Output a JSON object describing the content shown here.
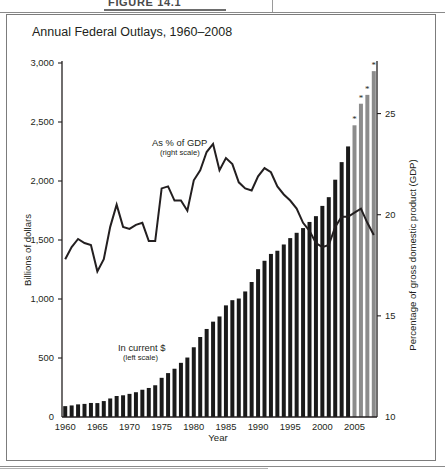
{
  "page": {
    "figure_caption": "FIGURE 14.1"
  },
  "chart": {
    "title": "Annual Federal Outlays, 1960–2008",
    "left_axis_title": "Billions of dollars",
    "right_axis_title": "Percentage of gross domestic product (GDP)",
    "x_axis_title": "Year",
    "annotation_bars_main": "In current $",
    "annotation_bars_sub": "(left scale)",
    "annotation_line_main": "As % of GDP",
    "annotation_line_sub": "(right scale)",
    "bar_color_actual": "#1a1a1a",
    "bar_color_estimate": "#8c8c8c",
    "line_color": "#231f20",
    "estimate_marker": "*"
  },
  "chart_data": {
    "type": "bar",
    "title": "Annual Federal Outlays, 1960–2008",
    "xlabel": "Year",
    "ylabel": "Billions of dollars",
    "ylabel_right": "Percentage of gross domestic product (GDP)",
    "ylim": [
      0,
      3000
    ],
    "yticks": [
      "0",
      "500",
      "1,000",
      "1,500",
      "2,000",
      "2,500",
      "3,000"
    ],
    "ylim_right": [
      10,
      27.5
    ],
    "yticks_right": [
      "10",
      "15",
      "20",
      "25"
    ],
    "xticks": [
      "1960",
      "1965",
      "1970",
      "1975",
      "1980",
      "1985",
      "1990",
      "1995",
      "2000",
      "2005"
    ],
    "grid": false,
    "legend": "in-plot annotations",
    "x": [
      1960,
      1961,
      1962,
      1963,
      1964,
      1965,
      1966,
      1967,
      1968,
      1969,
      1970,
      1971,
      1972,
      1973,
      1974,
      1975,
      1976,
      1977,
      1978,
      1979,
      1980,
      1981,
      1982,
      1983,
      1984,
      1985,
      1986,
      1987,
      1988,
      1989,
      1990,
      1991,
      1992,
      1993,
      1994,
      1995,
      1996,
      1997,
      1998,
      1999,
      2000,
      2001,
      2002,
      2003,
      2004,
      2005,
      2006,
      2007,
      2008
    ],
    "series": [
      {
        "name": "In current $ (left scale)",
        "type": "bar",
        "axis": "left",
        "unit": "billions of dollars",
        "values": [
          92,
          98,
          107,
          111,
          119,
          118,
          135,
          157,
          178,
          184,
          196,
          210,
          231,
          246,
          269,
          332,
          372,
          409,
          459,
          504,
          591,
          678,
          746,
          808,
          852,
          946,
          990,
          1004,
          1064,
          1144,
          1253,
          1324,
          1382,
          1409,
          1462,
          1516,
          1561,
          1601,
          1653,
          1702,
          1789,
          1863,
          2011,
          2160,
          2293,
          2472,
          2655,
          2730,
          2931
        ],
        "estimated_from": 2005,
        "estimated_years": [
          2005,
          2006,
          2007,
          2008
        ]
      },
      {
        "name": "As % of GDP (right scale)",
        "type": "line",
        "axis": "right",
        "unit": "percent of GDP",
        "values": [
          17.8,
          18.4,
          18.8,
          18.6,
          18.5,
          17.2,
          17.8,
          19.4,
          20.5,
          19.4,
          19.3,
          19.5,
          19.6,
          18.7,
          18.7,
          21.3,
          21.4,
          20.7,
          20.7,
          20.2,
          21.7,
          22.2,
          23.1,
          23.5,
          22.2,
          22.8,
          22.5,
          21.6,
          21.3,
          21.2,
          21.9,
          22.3,
          22.1,
          21.4,
          21.0,
          20.7,
          20.3,
          19.6,
          19.2,
          18.6,
          18.4,
          18.5,
          19.4,
          19.9,
          19.9,
          20.1,
          20.3,
          19.6,
          19.0
        ],
        "estimated_years": [
          2005,
          2006,
          2007,
          2008
        ]
      }
    ]
  }
}
